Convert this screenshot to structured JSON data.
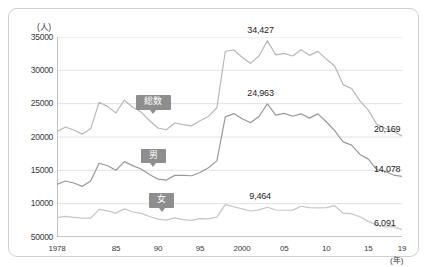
{
  "chart_data": {
    "type": "line",
    "title": "",
    "xlabel": "(年)",
    "ylabel": "(人)",
    "ylim": [
      5000,
      35000
    ],
    "ytick_values": [
      5000,
      10000,
      15000,
      20000,
      25000,
      30000,
      35000
    ],
    "ytick_labels": [
      "50000",
      "10000",
      "15000",
      "20000",
      "25000",
      "30000",
      "35000"
    ],
    "xlim": [
      1978,
      2019
    ],
    "xtick_years": [
      1978,
      1985,
      1990,
      1995,
      2000,
      2005,
      2010,
      2015,
      2019
    ],
    "xtick_labels": [
      "1978",
      "85",
      "90",
      "95",
      "2000",
      "05",
      "10",
      "15",
      "19"
    ],
    "grid": "horizontal",
    "legend_position": "inline-badges",
    "series": [
      {
        "name": "総数",
        "color": "#b8b8b8",
        "badge_label": "総数",
        "x": [
          1978,
          1979,
          1980,
          1981,
          1982,
          1983,
          1984,
          1985,
          1986,
          1987,
          1988,
          1989,
          1990,
          1991,
          1992,
          1993,
          1994,
          1995,
          1996,
          1997,
          1998,
          1999,
          2000,
          2001,
          2002,
          2003,
          2004,
          2005,
          2006,
          2007,
          2008,
          2009,
          2010,
          2011,
          2012,
          2013,
          2014,
          2015,
          2016,
          2017,
          2018,
          2019
        ],
        "values": [
          20788,
          21503,
          21048,
          20434,
          21228,
          25202,
          24596,
          23599,
          25524,
          24460,
          23742,
          22436,
          21346,
          21084,
          22104,
          21851,
          21679,
          22445,
          23104,
          24391,
          32863,
          33048,
          31957,
          31042,
          32143,
          34427,
          32325,
          32552,
          32155,
          33093,
          32249,
          32845,
          31690,
          30651,
          27858,
          27283,
          25427,
          24025,
          21897,
          21321,
          20840,
          20169
        ]
      },
      {
        "name": "男",
        "color": "#999999",
        "badge_label": "男",
        "x": [
          1978,
          1979,
          1980,
          1981,
          1982,
          1983,
          1984,
          1985,
          1986,
          1987,
          1988,
          1989,
          1990,
          1991,
          1992,
          1993,
          1994,
          1995,
          1996,
          1997,
          1998,
          1999,
          2000,
          2001,
          2002,
          2003,
          2004,
          2005,
          2006,
          2007,
          2008,
          2009,
          2010,
          2011,
          2012,
          2013,
          2014,
          2015,
          2016,
          2017,
          2018,
          2019
        ],
        "values": [
          12898,
          13398,
          13101,
          12600,
          13400,
          16063,
          15681,
          15013,
          16309,
          15705,
          15192,
          14363,
          13674,
          13542,
          14241,
          14252,
          14187,
          14679,
          15393,
          16416,
          23013,
          23512,
          22727,
          22144,
          23080,
          24963,
          23272,
          23540,
          23119,
          23478,
          22831,
          23472,
          22283,
          20955,
          19273,
          18787,
          17386,
          16681,
          15121,
          14826,
          14290,
          14078
        ]
      },
      {
        "name": "女",
        "color": "#c6c6c6",
        "badge_label": "女",
        "x": [
          1978,
          1979,
          1980,
          1981,
          1982,
          1983,
          1984,
          1985,
          1986,
          1987,
          1988,
          1989,
          1990,
          1991,
          1992,
          1993,
          1994,
          1995,
          1996,
          1997,
          1998,
          1999,
          2000,
          2001,
          2002,
          2003,
          2004,
          2005,
          2006,
          2007,
          2008,
          2009,
          2010,
          2011,
          2012,
          2013,
          2014,
          2015,
          2016,
          2017,
          2018,
          2019
        ],
        "values": [
          7890,
          8105,
          7947,
          7834,
          7828,
          9139,
          8915,
          8586,
          9215,
          8755,
          8550,
          8073,
          7672,
          7542,
          7863,
          7599,
          7492,
          7766,
          7711,
          7975,
          9850,
          9536,
          9230,
          8898,
          9063,
          9464,
          9053,
          9012,
          9036,
          9615,
          9418,
          9373,
          9407,
          9696,
          8585,
          8496,
          8041,
          7344,
          6776,
          6495,
          6550,
          6091
        ]
      }
    ],
    "annotations": [
      {
        "text": "34,427",
        "series": "総数",
        "year": 2003
      },
      {
        "text": "24,963",
        "series": "男",
        "year": 2003
      },
      {
        "text": "9,464",
        "series": "女",
        "year": 2003
      }
    ],
    "end_labels": [
      {
        "text": "20,169",
        "series": "総数"
      },
      {
        "text": "14,078",
        "series": "男"
      },
      {
        "text": "6,091",
        "series": "女"
      }
    ]
  },
  "axis": {
    "unit_y": "(人)",
    "unit_x": "(年)"
  }
}
